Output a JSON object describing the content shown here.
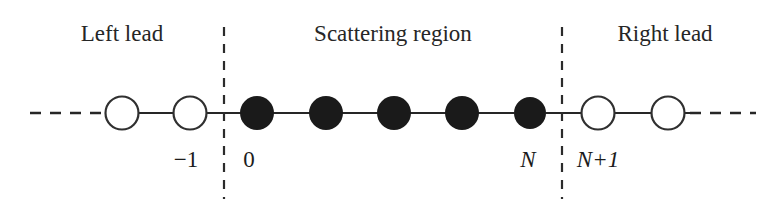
{
  "figure": {
    "type": "diagram",
    "background_color": "#ffffff",
    "line_color": "#262626",
    "filled_node_color": "#1a1a1a",
    "open_node_fill": "#ffffff",
    "open_node_stroke": "#262626"
  },
  "regions": [
    {
      "id": "left-lead",
      "label": "Left lead",
      "center_x": 122
    },
    {
      "id": "scattering-region",
      "label": "Scattering region",
      "center_x": 393
    },
    {
      "id": "right-lead",
      "label": "Right lead",
      "center_x": 665
    }
  ],
  "dividers": [
    {
      "id": "left-divider",
      "x": 224
    },
    {
      "id": "right-divider",
      "x": 562
    }
  ],
  "chain": {
    "baseline_y": 113,
    "node_radius": 16,
    "nodes": [
      {
        "id": "site-minus-1",
        "cx": 122,
        "style": "open",
        "label": null,
        "region": "left-lead"
      },
      {
        "id": "site-minus-1-labeled",
        "cx": 190,
        "style": "open",
        "label": "−1",
        "region": "left-lead"
      },
      {
        "id": "site-0",
        "cx": 257,
        "style": "filled",
        "label": "0",
        "region": "scattering-region"
      },
      {
        "id": "site-1",
        "cx": 326,
        "style": "filled",
        "label": null,
        "region": "scattering-region"
      },
      {
        "id": "site-2",
        "cx": 394,
        "style": "filled",
        "label": null,
        "region": "scattering-region"
      },
      {
        "id": "site-3",
        "cx": 462,
        "style": "filled",
        "label": null,
        "region": "scattering-region"
      },
      {
        "id": "site-N",
        "cx": 530,
        "style": "filled",
        "label": "N",
        "region": "scattering-region"
      },
      {
        "id": "site-N-plus-1",
        "cx": 598,
        "style": "open",
        "label": "N+1",
        "region": "right-lead"
      },
      {
        "id": "site-N-plus-2",
        "cx": 668,
        "style": "open",
        "label": null,
        "region": "right-lead"
      }
    ]
  },
  "site_labels": [
    {
      "id": "label-minus-1",
      "text": "−1",
      "x": 186,
      "italic": false
    },
    {
      "id": "label-0",
      "text": "0",
      "x": 249,
      "italic": false
    },
    {
      "id": "label-N",
      "text": "N",
      "x": 528,
      "italic": true
    },
    {
      "id": "label-N-plus-1",
      "text": "N+1",
      "x": 598,
      "italic": true
    }
  ],
  "continuation_dashes": {
    "left": {
      "from_x": 30,
      "to_x": 104,
      "y": 113
    },
    "right": {
      "from_x": 686,
      "to_x": 756,
      "y": 113
    }
  }
}
